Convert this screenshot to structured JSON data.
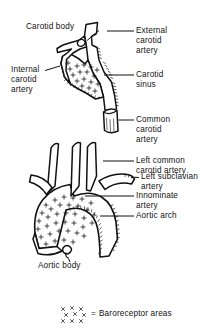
{
  "figure": {
    "kind": "anatomical-line-drawing",
    "style": "black and white pen-and-ink line art with stipple shading"
  },
  "labels": {
    "carotid_body": "Carotid body",
    "internal_carotid_artery": "Internal\ncarotid\nartery",
    "external_carotid_artery": "External\ncarotid\nartery",
    "carotid_sinus": "Carotid\nsinus",
    "common_carotid_artery": "Common\ncarotid\nartery",
    "left_common_carotid_artery": "Left common\ncarotid artery",
    "left_subclavian_artery": "Left subclavian\nartery",
    "innominate_artery": "Innominate\nartery",
    "aortic_arch": "Aortic arch",
    "aortic_body": "Aortic body"
  },
  "legend": {
    "symbol": "x-marks-cluster",
    "equals": "=",
    "text": "Baroreceptor areas"
  },
  "colors": {
    "ink": "#111111",
    "background": "#ffffff"
  }
}
